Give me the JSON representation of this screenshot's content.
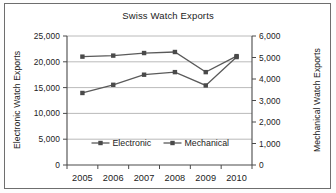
{
  "figure": {
    "title": "Swiss Watch Exports",
    "left_axis_title": "Electronic Watch Exports",
    "right_axis_title": "Mechanical Watch Exports"
  },
  "chart_data": {
    "type": "line",
    "title": "Swiss Watch Exports",
    "xlabel": "",
    "ylabel": "Electronic Watch Exports",
    "y2label": "Mechanical Watch Exports",
    "categories": [
      "2005",
      "2006",
      "2007",
      "2008",
      "2009",
      "2010"
    ],
    "ylim": [
      0,
      25000
    ],
    "y2lim": [
      0,
      6000
    ],
    "yticks": [
      "0",
      "5,000",
      "10,000",
      "15,000",
      "20,000",
      "25,000"
    ],
    "ytick_values": [
      0,
      5000,
      10000,
      15000,
      20000,
      25000
    ],
    "y2ticks": [
      "0",
      "1,000",
      "2,000",
      "3,000",
      "4,000",
      "5,000",
      "6,000"
    ],
    "y2tick_values": [
      0,
      1000,
      2000,
      3000,
      4000,
      5000,
      6000
    ],
    "grid": true,
    "legend_position": "inside-bottom-center",
    "series": [
      {
        "name": "Electronic",
        "axis": "left",
        "marker": "square",
        "values": [
          21000,
          21200,
          21700,
          21900,
          18000,
          21100
        ]
      },
      {
        "name": "Mechanical",
        "axis": "right",
        "marker": "square",
        "values": [
          3350,
          3730,
          4200,
          4320,
          3700,
          5020
        ]
      }
    ],
    "legend": [
      "Electronic",
      "Mechanical"
    ],
    "colors": {
      "series_line": "#5a5a5a",
      "marker": "#4a4a4a",
      "grid": "#a8a8a8",
      "axis": "#4a4a4a",
      "background": "#ffffff",
      "frame": "#6e6e6e"
    }
  }
}
